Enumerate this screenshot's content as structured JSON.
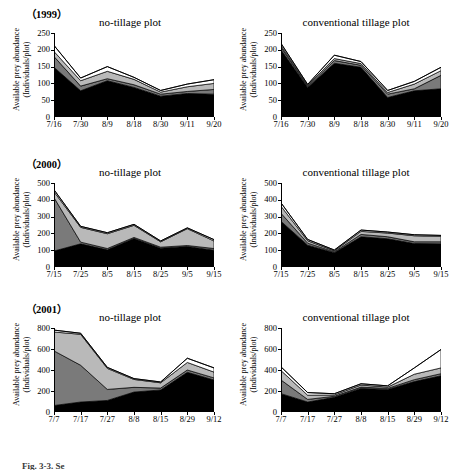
{
  "figure": {
    "caption": "Fig. 3-3. Se",
    "y_axis_label_line1": "Available prey abundance",
    "y_axis_label_line2": "(Individuals/plot)",
    "plot_titles": {
      "no_tillage": "no-tillage plot",
      "conventional": "conventional tillage plot"
    },
    "colors": {
      "layer1": "#000000",
      "layer2": "#7a7a7a",
      "layer3": "#b9b9b9",
      "layer4": "#ffffff",
      "outline": "#000000",
      "axis": "#000000"
    }
  },
  "rows": [
    {
      "year_label": "（1999）"
    },
    {
      "year_label": "（2000）"
    },
    {
      "year_label": "（2001）"
    }
  ],
  "chart_data": [
    {
      "type": "area",
      "title": "no-tillage plot",
      "year": "1999",
      "plot": "no-tillage",
      "xlabel": "",
      "ylabel": "Available prey abundance (Individuals/plot)",
      "ylim": [
        0,
        250
      ],
      "yticks": [
        0,
        50,
        100,
        150,
        200,
        250
      ],
      "grid": false,
      "legend": "none",
      "stacked": true,
      "categories": [
        "7/16",
        "7/30",
        "8/9",
        "8/18",
        "8/30",
        "9/11",
        "9/20"
      ],
      "series": [
        {
          "name": "layer1",
          "values": [
            148,
            78,
            108,
            88,
            62,
            70,
            68
          ]
        },
        {
          "name": "layer2",
          "values": [
            32,
            14,
            6,
            8,
            6,
            6,
            14
          ]
        },
        {
          "name": "layer3",
          "values": [
            15,
            16,
            22,
            16,
            6,
            14,
            18
          ]
        },
        {
          "name": "layer4",
          "values": [
            18,
            8,
            14,
            6,
            5,
            8,
            11
          ]
        }
      ],
      "totals": [
        213,
        116,
        150,
        118,
        79,
        98,
        111
      ]
    },
    {
      "type": "area",
      "title": "conventional tillage plot",
      "year": "1999",
      "plot": "conventional tillage",
      "xlabel": "",
      "ylabel": "Available prey abundance (Individuals/plot)",
      "ylim": [
        0,
        250
      ],
      "yticks": [
        0,
        50,
        100,
        150,
        200,
        250
      ],
      "grid": false,
      "legend": "none",
      "stacked": true,
      "categories": [
        "7/16",
        "7/30",
        "8/9",
        "8/18",
        "8/30",
        "9/11",
        "9/20"
      ],
      "series": [
        {
          "name": "layer1",
          "values": [
            200,
            88,
            160,
            148,
            58,
            78,
            84
          ]
        },
        {
          "name": "layer2",
          "values": [
            8,
            3,
            8,
            6,
            10,
            6,
            40
          ]
        },
        {
          "name": "layer3",
          "values": [
            5,
            3,
            6,
            5,
            5,
            14,
            14
          ]
        },
        {
          "name": "layer4",
          "values": [
            6,
            3,
            10,
            6,
            6,
            8,
            10
          ]
        }
      ],
      "totals": [
        219,
        97,
        184,
        165,
        79,
        106,
        148
      ]
    },
    {
      "type": "area",
      "title": "no-tillage plot",
      "year": "2000",
      "plot": "no-tillage",
      "xlabel": "",
      "ylabel": "Available prey abundance (Individuals/plot)",
      "ylim": [
        0,
        500
      ],
      "yticks": [
        0,
        100,
        200,
        300,
        400,
        500
      ],
      "grid": false,
      "legend": "none",
      "stacked": true,
      "categories": [
        "7/15",
        "7/25",
        "8/5",
        "8/15",
        "8/25",
        "9/5",
        "9/15"
      ],
      "series": [
        {
          "name": "layer1",
          "values": [
            95,
            138,
            102,
            170,
            112,
            122,
            100
          ]
        },
        {
          "name": "layer2",
          "values": [
            318,
            10,
            8,
            6,
            6,
            6,
            10
          ]
        },
        {
          "name": "layer3",
          "values": [
            35,
            88,
            88,
            72,
            32,
            100,
            45
          ]
        },
        {
          "name": "layer4",
          "values": [
            12,
            6,
            6,
            6,
            5,
            5,
            8
          ]
        }
      ],
      "totals": [
        460,
        242,
        204,
        254,
        155,
        233,
        163
      ]
    },
    {
      "type": "area",
      "title": "conventional tillage plot",
      "year": "2000",
      "plot": "conventional tillage",
      "xlabel": "",
      "ylabel": "Available prey abundance (Individuals/plot)",
      "ylim": [
        0,
        500
      ],
      "yticks": [
        0,
        100,
        200,
        300,
        400,
        500
      ],
      "grid": false,
      "legend": "none",
      "stacked": true,
      "categories": [
        "7/15",
        "7/25",
        "8/5",
        "8/15",
        "8/25",
        "9/5",
        "9/15"
      ],
      "series": [
        {
          "name": "layer1",
          "values": [
            272,
            130,
            85,
            180,
            168,
            140,
            138
          ]
        },
        {
          "name": "layer2",
          "values": [
            48,
            12,
            5,
            14,
            12,
            10,
            12
          ]
        },
        {
          "name": "layer3",
          "values": [
            42,
            14,
            6,
            18,
            22,
            36,
            32
          ]
        },
        {
          "name": "layer4",
          "values": [
            20,
            8,
            5,
            8,
            6,
            6,
            6
          ]
        }
      ],
      "totals": [
        382,
        164,
        101,
        220,
        208,
        192,
        188
      ]
    },
    {
      "type": "area",
      "title": "no-tillage plot",
      "year": "2001",
      "plot": "no-tillage",
      "xlabel": "",
      "ylabel": "Available prey abundance (Individuals/plot)",
      "ylim": [
        0,
        800
      ],
      "yticks": [
        0,
        200,
        400,
        600,
        800
      ],
      "grid": false,
      "legend": "none",
      "stacked": true,
      "categories": [
        "7/7",
        "7/17",
        "7/27",
        "8/8",
        "8/15",
        "8/29",
        "9/12"
      ],
      "series": [
        {
          "name": "layer1",
          "values": [
            62,
            95,
            110,
            190,
            210,
            378,
            305
          ]
        },
        {
          "name": "layer2",
          "values": [
            520,
            350,
            105,
            45,
            18,
            22,
            20
          ]
        },
        {
          "name": "layer3",
          "values": [
            180,
            295,
            200,
            75,
            50,
            72,
            55
          ]
        },
        {
          "name": "layer4",
          "values": [
            18,
            10,
            10,
            8,
            8,
            40,
            40
          ]
        }
      ],
      "totals": [
        780,
        750,
        425,
        318,
        286,
        512,
        420
      ]
    },
    {
      "type": "area",
      "title": "conventional tillage plot",
      "year": "2001",
      "plot": "conventional tillage",
      "xlabel": "",
      "ylabel": "Available prey abundance (Individuals/plot)",
      "ylim": [
        0,
        800
      ],
      "yticks": [
        0,
        200,
        400,
        600,
        800
      ],
      "grid": false,
      "legend": "none",
      "stacked": true,
      "categories": [
        "7/7",
        "7/17",
        "7/27",
        "8/8",
        "8/15",
        "8/29",
        "9/12"
      ],
      "series": [
        {
          "name": "layer1",
          "values": [
            175,
            95,
            140,
            225,
            215,
            290,
            345
          ]
        },
        {
          "name": "layer2",
          "values": [
            130,
            25,
            10,
            12,
            10,
            18,
            20
          ]
        },
        {
          "name": "layer3",
          "values": [
            90,
            40,
            12,
            20,
            12,
            52,
            55
          ]
        },
        {
          "name": "layer4",
          "values": [
            35,
            25,
            12,
            12,
            12,
            60,
            175
          ]
        }
      ],
      "totals": [
        430,
        185,
        174,
        269,
        249,
        420,
        595
      ]
    }
  ]
}
